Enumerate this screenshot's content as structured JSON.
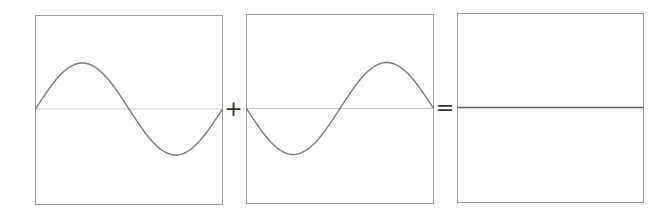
{
  "diagram": {
    "operators": {
      "plus": "+",
      "equals": "="
    },
    "panels": [
      {
        "id": "wave-a",
        "kind": "sine",
        "phase": 0,
        "cycles": 1,
        "amplitude": 46
      },
      {
        "id": "wave-b",
        "kind": "sine",
        "phase": 180,
        "cycles": 1,
        "amplitude": 46
      },
      {
        "id": "result",
        "kind": "flat",
        "amplitude": 0
      }
    ],
    "colors": {
      "frame": "#9a9a9a",
      "wave": "#7a7a7a",
      "baseline": "#c8c8c8",
      "result_line": "#5a5a5a",
      "operator": "#333333"
    }
  }
}
